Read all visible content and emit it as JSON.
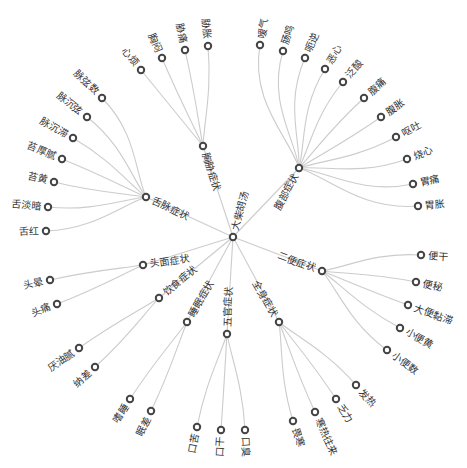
{
  "diagram": {
    "type": "radial-tree",
    "root": {
      "name": "大柴胡汤",
      "x": 233,
      "y": 237,
      "label_angle": -75,
      "label_side": "right"
    },
    "branches": [
      {
        "name": "胸胁症状",
        "x": 203,
        "y": 146,
        "label_angle": 72,
        "label_side": "right",
        "children": [
          {
            "name": "心烦",
            "x": 141,
            "y": 70,
            "angle": -129
          },
          {
            "name": "胸闷",
            "x": 162,
            "y": 58,
            "angle": -113
          },
          {
            "name": "胁痛",
            "x": 185,
            "y": 50,
            "angle": -103
          },
          {
            "name": "胁胀",
            "x": 208,
            "y": 46,
            "angle": -95
          }
        ]
      },
      {
        "name": "腹部症状",
        "x": 299,
        "y": 168,
        "label_angle": -62,
        "label_side": "left",
        "children": [
          {
            "name": "嗳气",
            "x": 260,
            "y": 45,
            "angle": -80
          },
          {
            "name": "肠鸣",
            "x": 283,
            "y": 51,
            "angle": -73
          },
          {
            "name": "呃逆",
            "x": 305,
            "y": 58,
            "angle": -66
          },
          {
            "name": "恶心",
            "x": 325,
            "y": 69,
            "angle": -58
          },
          {
            "name": "泛酸",
            "x": 343,
            "y": 82,
            "angle": -50
          },
          {
            "name": "腹痛",
            "x": 364,
            "y": 98,
            "angle": -42
          },
          {
            "name": "腹胀",
            "x": 381,
            "y": 117,
            "angle": -35
          },
          {
            "name": "呕吐",
            "x": 396,
            "y": 137,
            "angle": -28
          },
          {
            "name": "烧心",
            "x": 407,
            "y": 159,
            "angle": -20
          },
          {
            "name": "胃痛",
            "x": 413,
            "y": 184,
            "angle": -12
          },
          {
            "name": "胃胀",
            "x": 418,
            "y": 206,
            "angle": -5
          }
        ]
      },
      {
        "name": "舌脉症状",
        "x": 146,
        "y": 197,
        "label_angle": 25,
        "label_side": "right",
        "children": [
          {
            "name": "脉弦数",
            "x": 102,
            "y": 98,
            "angle": -135
          },
          {
            "name": "脉沉弦",
            "x": 87,
            "y": 117,
            "angle": -142
          },
          {
            "name": "脉沉滞",
            "x": 73,
            "y": 138,
            "angle": -150
          },
          {
            "name": "苔厚腻",
            "x": 62,
            "y": 159,
            "angle": -158
          },
          {
            "name": "苔黄",
            "x": 54,
            "y": 182,
            "angle": -166
          },
          {
            "name": "舌淡暗",
            "x": 48,
            "y": 207,
            "angle": -174
          },
          {
            "name": "舌红",
            "x": 46,
            "y": 231,
            "angle": 178
          }
        ]
      },
      {
        "name": "头面症状",
        "x": 143,
        "y": 265,
        "label_angle": -8,
        "label_side": "right",
        "children": [
          {
            "name": "头晕",
            "x": 50,
            "y": 280,
            "angle": 167
          },
          {
            "name": "头痛",
            "x": 57,
            "y": 304,
            "angle": 159
          }
        ]
      },
      {
        "name": "饮食症状",
        "x": 159,
        "y": 298,
        "label_angle": -40,
        "label_side": "right",
        "children": [
          {
            "name": "厌油腻",
            "x": 79,
            "y": 348,
            "angle": 145
          },
          {
            "name": "纳差",
            "x": 95,
            "y": 367,
            "angle": 138
          }
        ]
      },
      {
        "name": "睡眠症状",
        "x": 187,
        "y": 322,
        "label_angle": -60,
        "label_side": "right",
        "children": [
          {
            "name": "嗜睡",
            "x": 130,
            "y": 399,
            "angle": 123
          },
          {
            "name": "眠差",
            "x": 151,
            "y": 411,
            "angle": 116
          }
        ]
      },
      {
        "name": "五官症状",
        "x": 227,
        "y": 334,
        "label_angle": -88,
        "label_side": "right",
        "children": [
          {
            "name": "口苦",
            "x": 197,
            "y": 427,
            "angle": 101
          },
          {
            "name": "口干",
            "x": 221,
            "y": 430,
            "angle": 94
          },
          {
            "name": "口臭",
            "x": 245,
            "y": 430,
            "angle": 87
          }
        ]
      },
      {
        "name": "全身症状",
        "x": 279,
        "y": 322,
        "label_angle": 60,
        "label_side": "left",
        "children": [
          {
            "name": "畏寒",
            "x": 293,
            "y": 421,
            "angle": 73
          },
          {
            "name": "寒热往来",
            "x": 315,
            "y": 412,
            "angle": 65
          },
          {
            "name": "乏力",
            "x": 336,
            "y": 399,
            "angle": 57
          },
          {
            "name": "发热",
            "x": 356,
            "y": 385,
            "angle": 49
          }
        ]
      },
      {
        "name": "二便症状",
        "x": 322,
        "y": 271,
        "label_angle": 20,
        "label_side": "left",
        "children": [
          {
            "name": "便干",
            "x": 421,
            "y": 255,
            "angle": 4
          },
          {
            "name": "便秘",
            "x": 416,
            "y": 282,
            "angle": 12
          },
          {
            "name": "大便黏滞",
            "x": 408,
            "y": 305,
            "angle": 20
          },
          {
            "name": "小便黄",
            "x": 400,
            "y": 328,
            "angle": 28
          },
          {
            "name": "小便数",
            "x": 387,
            "y": 350,
            "angle": 36
          }
        ]
      }
    ],
    "colors": {
      "link": "#cccccc",
      "node_stroke": "#444444",
      "node_fill": "#ffffff",
      "text": "#333333"
    }
  }
}
